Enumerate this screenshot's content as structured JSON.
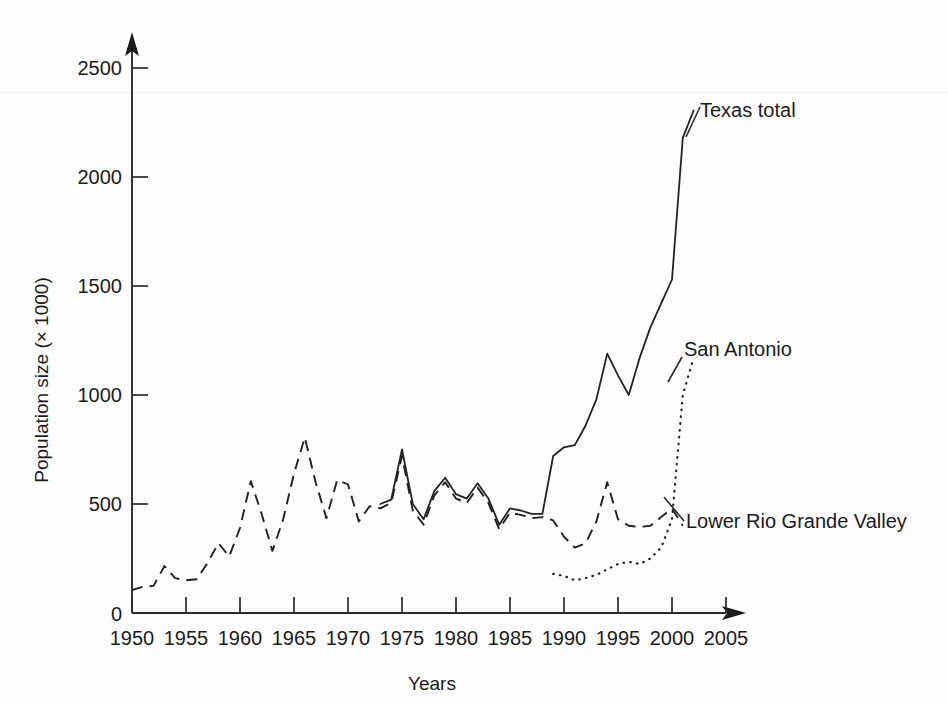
{
  "chart_data": {
    "type": "line",
    "title": "",
    "xlabel": "Years",
    "ylabel": "Population size (× 1000)",
    "xlim": [
      1950,
      2005
    ],
    "ylim": [
      0,
      2500
    ],
    "xticks": [
      1950,
      1955,
      1960,
      1965,
      1970,
      1975,
      1980,
      1985,
      1990,
      1995,
      2000,
      2005
    ],
    "yticks": [
      0,
      500,
      1000,
      1500,
      2000,
      2500
    ],
    "grid": false,
    "legend_position": "inline-annotations",
    "series": [
      {
        "name": "Texas total",
        "style": "solid",
        "x": [
          1973,
          1974,
          1975,
          1976,
          1977,
          1978,
          1979,
          1980,
          1981,
          1982,
          1983,
          1984,
          1985,
          1986,
          1987,
          1988,
          1989,
          1990,
          1991,
          1992,
          1993,
          1994,
          1995,
          1996,
          1997,
          1998,
          1999,
          2000,
          2001,
          2002
        ],
        "values": [
          500,
          520,
          750,
          500,
          430,
          560,
          620,
          545,
          525,
          595,
          525,
          405,
          480,
          470,
          455,
          455,
          720,
          760,
          770,
          860,
          980,
          1190,
          1090,
          1000,
          1170,
          1310,
          1420,
          1530,
          2180,
          2305
        ]
      },
      {
        "name": "San Antonio",
        "style": "dotted",
        "x": [
          1989,
          1990,
          1991,
          1992,
          1993,
          1994,
          1995,
          1996,
          1997,
          1998,
          1999,
          2000,
          2001,
          2002
        ],
        "values": [
          180,
          170,
          150,
          160,
          175,
          200,
          225,
          235,
          225,
          250,
          300,
          430,
          1000,
          1170
        ]
      },
      {
        "name": "Lower Rio Grande Valley",
        "style": "dashed",
        "x": [
          1950,
          1951,
          1952,
          1953,
          1954,
          1955,
          1956,
          1957,
          1958,
          1959,
          1960,
          1961,
          1962,
          1963,
          1964,
          1965,
          1966,
          1967,
          1968,
          1969,
          1970,
          1971,
          1972,
          1973,
          1974,
          1975,
          1976,
          1977,
          1978,
          1979,
          1980,
          1981,
          1982,
          1983,
          1984,
          1985,
          1986,
          1987,
          1988,
          1989,
          1990,
          1991,
          1992,
          1993,
          1994,
          1995,
          1996,
          1997,
          1998,
          1999,
          2000,
          2001
        ],
        "values": [
          105,
          120,
          125,
          215,
          160,
          150,
          155,
          230,
          320,
          260,
          390,
          605,
          455,
          285,
          430,
          640,
          805,
          600,
          435,
          610,
          590,
          420,
          490,
          480,
          505,
          720,
          470,
          405,
          540,
          600,
          525,
          505,
          575,
          505,
          385,
          460,
          450,
          435,
          440,
          425,
          350,
          300,
          320,
          420,
          600,
          430,
          400,
          395,
          400,
          440,
          480,
          400
        ]
      }
    ],
    "annotations": [
      {
        "label": "Texas total",
        "x_px": 698,
        "y_px": 118
      },
      {
        "label": "San Antonio",
        "x_px": 684,
        "y_px": 356
      },
      {
        "label": "Lower Rio Grande Valley",
        "x_px": 682,
        "y_px": 523
      }
    ]
  },
  "axes": {
    "y_tick_labels": [
      "2500",
      "2000",
      "1500",
      "1000",
      "500",
      "0"
    ],
    "x_tick_labels": [
      "1950",
      "1955",
      "1960",
      "1965",
      "1970",
      "1975",
      "1980",
      "1985",
      "1990",
      "1995",
      "2000",
      "2005"
    ],
    "x_axis_title": "Years",
    "y_axis_title": "Population size (× 1000)"
  },
  "colors": {
    "ink": "#222222",
    "background": "#fdfdfd"
  }
}
